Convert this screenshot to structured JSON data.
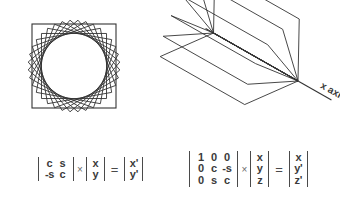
{
  "figures": {
    "rotation_2d": {
      "name": "2d-rotation-squares",
      "description": "Set of squares rotated about the origin in the plane, envelope forms a circle",
      "shape": "square",
      "count": 9,
      "rotation_step_degrees": 10,
      "square_half_size": 46,
      "center": {
        "x": 68,
        "y": 62
      },
      "base_square_half_size": 42,
      "stroke": "#333333",
      "stroke_width": 0.9
    },
    "rotation_3d": {
      "name": "3d-rotation-about-x-axis",
      "description": "Set of squares rotated about the x axis in 3D, fanned out like a book",
      "axis_label": "x axis",
      "count": 6,
      "rotation_step_degrees": 18,
      "stroke": "#333333",
      "stroke_width": 0.9,
      "axis_stroke_width": 1.1,
      "axis_start": {
        "x": 8,
        "y": 14
      },
      "axis_end": {
        "x": 178,
        "y": 112
      },
      "hinge": {
        "x": 146,
        "y": 77
      },
      "label_rotation_degrees": 30
    }
  },
  "formulas": {
    "rotation_2d": {
      "name": "2d-rotation-matrix-equation",
      "matrix": {
        "rows": [
          [
            "c",
            "s"
          ],
          [
            "-s",
            "c"
          ]
        ]
      },
      "vector": {
        "rows": [
          [
            "x"
          ],
          [
            "y"
          ]
        ]
      },
      "result": {
        "rows": [
          [
            "x'"
          ],
          [
            "y'"
          ]
        ]
      },
      "multiply_symbol": "×",
      "equals_symbol": "="
    },
    "rotation_3d": {
      "name": "3d-rotation-matrix-equation",
      "matrix": {
        "rows": [
          [
            "1",
            "0",
            "0"
          ],
          [
            "0",
            "c",
            "-s"
          ],
          [
            "0",
            "s",
            "c"
          ]
        ]
      },
      "vector": {
        "rows": [
          [
            "x"
          ],
          [
            "y"
          ],
          [
            "z"
          ]
        ]
      },
      "result": {
        "rows": [
          [
            "x"
          ],
          [
            "y'"
          ],
          [
            "z'"
          ]
        ]
      },
      "multiply_symbol": "×",
      "equals_symbol": "="
    }
  },
  "colors": {
    "background": "#ffffff",
    "line": "#333333",
    "text": "#3a3a3a",
    "operator": "#6b6b6b"
  }
}
